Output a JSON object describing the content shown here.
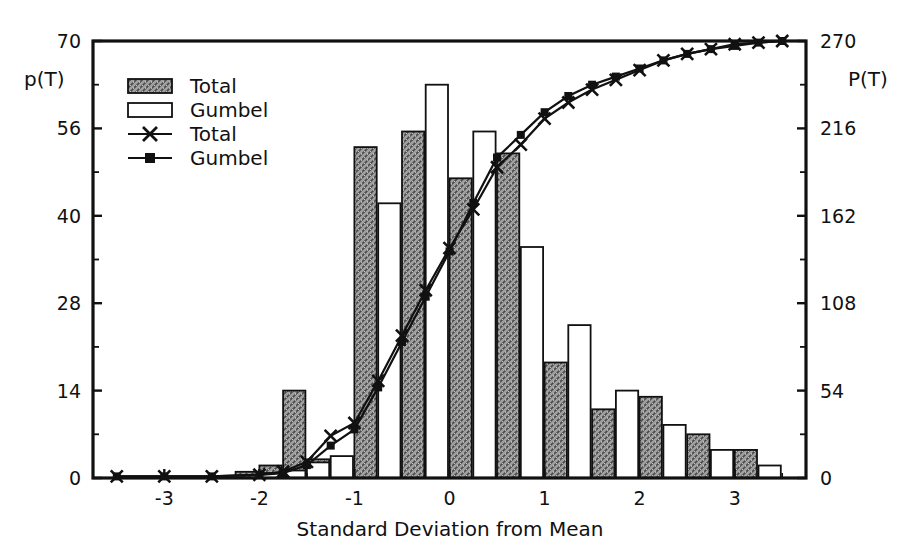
{
  "chart_data": {
    "type": "bar",
    "title": "",
    "xlabel": "Standard Deviation from Mean",
    "ylabel": "p(T)",
    "ylabel_right": "P(T)",
    "xlim": [
      -3.75,
      3.75
    ],
    "ylim": [
      0,
      70
    ],
    "ylim_right": [
      0,
      270
    ],
    "grid": false,
    "legend_position": "top-left",
    "xticks": [
      -3,
      -2,
      -1,
      0,
      1,
      2,
      3
    ],
    "xticklabels": [
      "-3",
      "-2",
      "-1",
      "0",
      "1",
      "2",
      "3"
    ],
    "yticks": [
      0,
      14,
      28,
      40,
      56,
      70
    ],
    "yticklabels": [
      "0",
      "14",
      "28",
      "40",
      "56",
      "70"
    ],
    "yticks_right": [
      0,
      54,
      108,
      162,
      216,
      270
    ],
    "yticklabels_right": [
      "0",
      "54",
      "108",
      "162",
      "216",
      "270"
    ],
    "bin_width": 0.5,
    "categories": [
      -3.5,
      -3.0,
      -2.5,
      -2.0,
      -1.75,
      -1.5,
      -1.25,
      -1.0,
      -0.5,
      0.0,
      0.5,
      1.0,
      1.5,
      2.0,
      2.5,
      3.0,
      3.5
    ],
    "series": [
      {
        "name": "Total",
        "kind": "bar",
        "fill": "hatched",
        "axis": "left",
        "x": [
          -2.0,
          -1.75,
          -1.5,
          -1.25,
          -0.75,
          -0.25,
          0.25,
          0.75,
          1.25,
          1.75,
          2.25,
          2.75,
          3.25
        ],
        "values": [
          1.0,
          2.0,
          14.0,
          3.0,
          53.0,
          55.5,
          48.0,
          52.0,
          18.5,
          11.0,
          13.0,
          7.0,
          4.5
        ]
      },
      {
        "name": "Gumbel",
        "kind": "bar",
        "fill": "white",
        "axis": "left",
        "x": [
          -2.0,
          -1.75,
          -1.5,
          -1.25,
          -0.75,
          -0.25,
          0.25,
          0.75,
          1.25,
          1.75,
          2.25,
          2.75,
          3.25
        ],
        "values": [
          0.8,
          1.2,
          2.5,
          3.5,
          44.0,
          63.0,
          55.5,
          37.0,
          24.5,
          14.0,
          8.5,
          4.5,
          2.0
        ]
      },
      {
        "name": "Total",
        "kind": "line",
        "marker": "x",
        "axis": "right",
        "x": [
          -3.5,
          -3.0,
          -2.5,
          -2.0,
          -1.75,
          -1.5,
          -1.25,
          -1.0,
          -0.75,
          -0.5,
          -0.25,
          0.0,
          0.25,
          0.5,
          0.75,
          1.0,
          1.25,
          1.5,
          1.75,
          2.0,
          2.25,
          2.5,
          2.75,
          3.0,
          3.25,
          3.5
        ],
        "values": [
          1,
          1,
          1,
          2,
          4,
          10,
          26,
          34,
          60,
          88,
          116,
          142,
          166,
          192,
          206,
          222,
          232,
          240,
          246,
          252,
          258,
          262,
          265,
          268,
          269,
          270
        ]
      },
      {
        "name": "Gumbel",
        "kind": "line",
        "marker": "square",
        "axis": "right",
        "x": [
          -3.5,
          -3.0,
          -2.5,
          -2.0,
          -1.75,
          -1.5,
          -1.25,
          -1.0,
          -0.75,
          -0.5,
          -0.25,
          0.0,
          0.25,
          0.5,
          0.75,
          1.0,
          1.25,
          1.5,
          1.75,
          2.0,
          2.25,
          2.5,
          2.75,
          3.0,
          3.25,
          3.5
        ],
        "values": [
          1,
          1,
          1,
          2,
          3,
          8,
          20,
          30,
          56,
          84,
          112,
          140,
          170,
          198,
          212,
          226,
          236,
          243,
          248,
          253,
          258,
          262,
          265,
          267,
          269,
          270
        ]
      }
    ],
    "legend": [
      {
        "label": "Total",
        "type": "bar-hatched"
      },
      {
        "label": "Gumbel",
        "type": "bar-white"
      },
      {
        "label": "Total",
        "type": "line-x"
      },
      {
        "label": "Gumbel",
        "type": "line-square"
      }
    ]
  },
  "colors": {
    "axis": "#111111",
    "bar_total_fill": "#9a9a9a",
    "bar_gumbel_fill": "#ffffff",
    "line": "#111111",
    "background": "#ffffff"
  }
}
